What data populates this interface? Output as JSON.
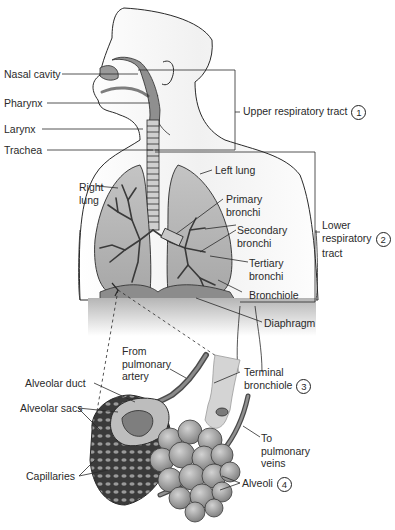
{
  "diagram": {
    "regions": {
      "upper": {
        "label": "Upper respiratory tract",
        "number": "1"
      },
      "lower": {
        "label_lines": [
          "Lower",
          "respiratory",
          "tract"
        ],
        "number": "2"
      }
    },
    "labels": {
      "nasal_cavity": "Nasal cavity",
      "pharynx": "Pharynx",
      "larynx": "Larynx",
      "trachea": "Trachea",
      "right_lung": [
        "Right",
        "lung"
      ],
      "left_lung": "Left lung",
      "primary_bronchi": [
        "Primary",
        "bronchi"
      ],
      "secondary_bronchi": [
        "Secondary",
        "bronchi"
      ],
      "tertiary_bronchi": [
        "Tertiary",
        "bronchi"
      ],
      "bronchiole": "Bronchiole",
      "diaphragm": "Diaphragm",
      "from_pulmonary_artery": [
        "From",
        "pulmonary",
        "artery"
      ],
      "terminal_bronchiole": [
        "Terminal",
        "bronchiole"
      ],
      "terminal_bronchiole_number": "3",
      "alveolar_duct": "Alveolar duct",
      "alveolar_sacs": "Alveolar sacs",
      "to_pulmonary_veins": [
        "To",
        "pulmonary",
        "veins"
      ],
      "capillaries": "Capillaries",
      "alveoli": "Alveoli",
      "alveoli_number": "4"
    },
    "colors": {
      "outline": "#2a2a2a",
      "tissue_dark": "#8a8a8a",
      "tissue_mid": "#a9a9a9",
      "lung_fill": "#b8b8b8",
      "skin": "#f4f4f4"
    }
  }
}
